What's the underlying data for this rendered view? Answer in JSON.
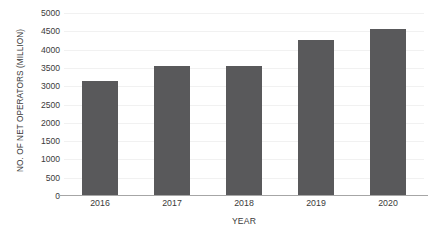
{
  "chart_data": {
    "type": "bar",
    "title": "",
    "xlabel": "YEAR",
    "ylabel": "NO. OF NET OPERATORS (MILLION)",
    "categories": [
      "2016",
      "2017",
      "2018",
      "2019",
      "2020"
    ],
    "values": [
      3150,
      3560,
      3565,
      4250,
      4550
    ],
    "series": [
      {
        "name": "No. of net operators",
        "values": [
          3150,
          3560,
          3565,
          4250,
          4550
        ]
      }
    ],
    "ylim": [
      0,
      5000
    ],
    "yticks": [
      0,
      500,
      1000,
      1500,
      2000,
      2500,
      3000,
      3500,
      4000,
      4500,
      5000
    ],
    "ytick_labels": [
      "0",
      "500",
      "1000",
      "1500",
      "2000",
      "2500",
      "3000",
      "3500",
      "4000",
      "4500",
      "5000"
    ],
    "grid": true,
    "grid_axis": "y",
    "legend": false,
    "bar_color": "#59595b",
    "gridline_color": "#f1f1f1",
    "axis_line_color": "#a6a6a6",
    "text_color": "#3b3b3b",
    "background_color": "#ffffff"
  }
}
